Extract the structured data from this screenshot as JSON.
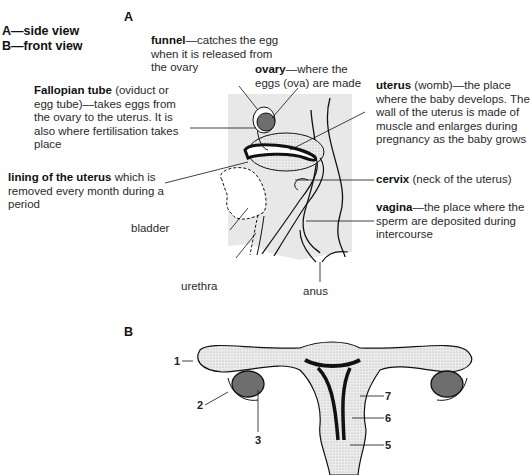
{
  "legend": {
    "a": "A—side view",
    "b": "B—front view"
  },
  "sections": {
    "a": "A",
    "b": "B"
  },
  "side_view_labels": {
    "funnel": {
      "term": "funnel",
      "desc": "—catches the egg when it is released from the ovary"
    },
    "ovary": {
      "term": "ovary",
      "desc": "—where the eggs (ova) are made"
    },
    "fallopian": {
      "term": "Fallopian tube",
      "desc": " (oviduct or egg tube)—takes eggs from the ovary to the uterus. It is also where fertilisation takes place"
    },
    "uterus": {
      "term": "uterus",
      "desc": " (womb)—the place where the baby develops. The wall of the uterus is made of muscle and enlarges during pregnancy as the baby grows"
    },
    "lining": {
      "term": "lining of the uterus",
      "desc": " which is removed every month during a period"
    },
    "cervix": {
      "term": "cervix",
      "desc": " (neck of the uterus)"
    },
    "vagina": {
      "term": "vagina",
      "desc": "—the place where the sperm are deposited during intercourse"
    },
    "bladder": "bladder",
    "urethra": "urethra",
    "anus": "anus"
  },
  "front_view_numbers": [
    "1",
    "2",
    "3",
    "5",
    "6",
    "7"
  ],
  "colors": {
    "body_fill": "#e6e6e6",
    "stipple": "#d4d4d4",
    "ovary_fill": "#6e6e6e",
    "outline": "#111111"
  }
}
